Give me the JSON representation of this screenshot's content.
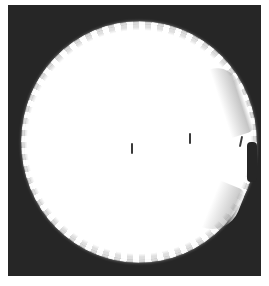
{
  "image": {
    "description": "Photograph of a round white scalloped-edge dish (petri dish / cap) on a dark background",
    "colors": {
      "background": "#262626",
      "dish": "#ffffff",
      "border": "#ffffff",
      "marks": "#3a3a3a"
    },
    "marks": [
      {
        "x": 131,
        "y": 148
      },
      {
        "x": 189,
        "y": 138
      },
      {
        "x": 240,
        "y": 141
      }
    ]
  }
}
